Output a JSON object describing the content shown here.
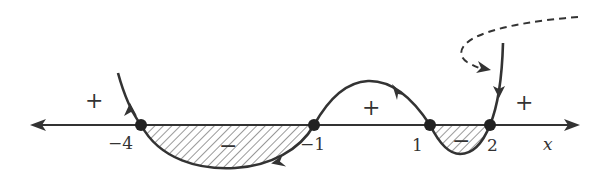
{
  "diagram": {
    "type": "sign-chart (wavy curve method)",
    "axis": {
      "label": "x",
      "direction": "both"
    },
    "roots": [
      {
        "label": "−4",
        "value": -4
      },
      {
        "label": "−1",
        "value": -1
      },
      {
        "label": "1",
        "value": 1
      },
      {
        "label": "2",
        "value": 2
      }
    ],
    "intervals": [
      {
        "range": "(-∞, -4)",
        "sign": "+",
        "shaded": false
      },
      {
        "range": "(-4, -1)",
        "sign": "−",
        "shaded": true
      },
      {
        "range": "(-1, 1)",
        "sign": "+",
        "shaded": false
      },
      {
        "range": "(1, 2)",
        "sign": "−",
        "shaded": true
      },
      {
        "range": "(2, ∞)",
        "sign": "+",
        "shaded": false
      }
    ],
    "colors": {
      "stroke": "#333333",
      "hatch": "#999999",
      "background": "#ffffff"
    }
  }
}
